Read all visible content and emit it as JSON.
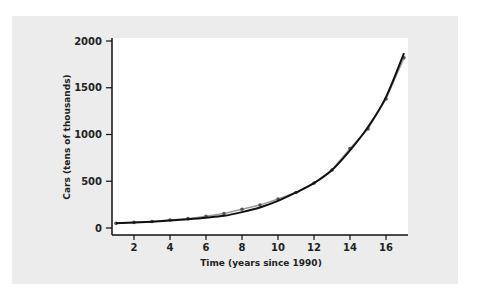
{
  "chart_data": {
    "type": "line",
    "title": "",
    "xlabel": "Time (years since 1990)",
    "ylabel": "Cars (tens of thousands)",
    "x": [
      1,
      2,
      3,
      4,
      5,
      6,
      7,
      8,
      9,
      10,
      11,
      12,
      13,
      14,
      15,
      16,
      17
    ],
    "series": [
      {
        "name": "data",
        "values": [
          50,
          60,
          70,
          85,
          100,
          125,
          155,
          200,
          245,
          310,
          380,
          480,
          620,
          850,
          1060,
          1380,
          1820
        ],
        "style": "gray line with point markers"
      },
      {
        "name": "exponential fit",
        "values": [
          50,
          58,
          68,
          80,
          94,
          110,
          130,
          170,
          220,
          290,
          380,
          480,
          620,
          830,
          1080,
          1400,
          1870
        ],
        "style": "black smooth curve"
      }
    ],
    "xticks": [
      2,
      4,
      6,
      8,
      10,
      12,
      14,
      16
    ],
    "yticks": [
      0,
      500,
      1000,
      1500,
      2000
    ],
    "xlim": [
      0.5,
      17.5
    ],
    "ylim": [
      -80,
      2040
    ],
    "grid": false,
    "legend": null
  },
  "axes": {
    "xtick_labels": [
      "2",
      "4",
      "6",
      "8",
      "10",
      "12",
      "14",
      "16"
    ],
    "ytick_labels": [
      "0",
      "500",
      "1000",
      "1500",
      "2000"
    ],
    "xlabel": "Time (years since 1990)",
    "ylabel": "Cars (tens of thousands)"
  },
  "colors": {
    "panel": "#ececec",
    "plot_bg": "#ffffff",
    "curve": "#111111",
    "data_line": "#9a9a9a"
  }
}
